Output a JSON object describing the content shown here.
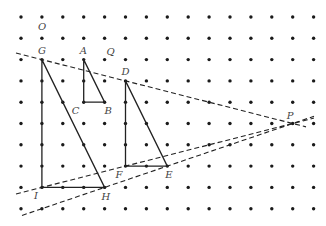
{
  "diagram": {
    "type": "dot-grid geometric construction",
    "grid": {
      "columns": 15,
      "rows": 10,
      "origin_px": [
        21,
        17
      ],
      "spacing_px": [
        20.9,
        21.3
      ],
      "dot_color": "#1a1a1a"
    },
    "points": [
      {
        "label": "O",
        "col": 1,
        "row": 1,
        "label_dx": -4,
        "label_dy": -8
      },
      {
        "label": "G",
        "col": 1,
        "row": 2,
        "label_dx": -4,
        "label_dy": -6
      },
      {
        "label": "A",
        "col": 3,
        "row": 2,
        "label_dx": -4,
        "label_dy": -6
      },
      {
        "label": "Q",
        "col": 4,
        "row": 2,
        "label_dx": 2,
        "label_dy": -5
      },
      {
        "label": "C",
        "col": 3,
        "row": 4,
        "label_dx": -12,
        "label_dy": 12
      },
      {
        "label": "B",
        "col": 4,
        "row": 4,
        "label_dx": 0,
        "label_dy": 12
      },
      {
        "label": "D",
        "col": 5,
        "row": 3,
        "label_dx": -4,
        "label_dy": -6
      },
      {
        "label": "F",
        "col": 5,
        "row": 7,
        "label_dx": -10,
        "label_dy": 12
      },
      {
        "label": "E",
        "col": 7,
        "row": 7,
        "label_dx": -2,
        "label_dy": 12
      },
      {
        "label": "I",
        "col": 1,
        "row": 8,
        "label_dx": -8,
        "label_dy": 12
      },
      {
        "label": "H",
        "col": 4,
        "row": 8,
        "label_dx": -3,
        "label_dy": 13
      },
      {
        "label": "P",
        "col": 13,
        "row": 5,
        "label_dx": -6,
        "label_dy": -5
      }
    ],
    "triangles": [
      {
        "name": "triangle-ABC",
        "vertices": [
          "A",
          "B",
          "C"
        ]
      },
      {
        "name": "triangle-DEF",
        "vertices": [
          "D",
          "E",
          "F"
        ]
      },
      {
        "name": "triangle-GHI",
        "vertices": [
          "G",
          "H",
          "I"
        ]
      }
    ],
    "dashed_lines": [
      {
        "name": "line-GDP",
        "through": [
          "G",
          "D",
          "P"
        ],
        "extend_from_x": 16,
        "extend_to_x": 306
      },
      {
        "name": "line-IFP",
        "through": [
          "I",
          "F",
          "P"
        ],
        "extend_from_x": 16,
        "extend_to_x": 314
      },
      {
        "name": "line-HEP",
        "through": [
          "H",
          "E",
          "P"
        ],
        "extend_from_x": 22,
        "extend_to_x": 314
      }
    ],
    "line_color": "#222222"
  }
}
